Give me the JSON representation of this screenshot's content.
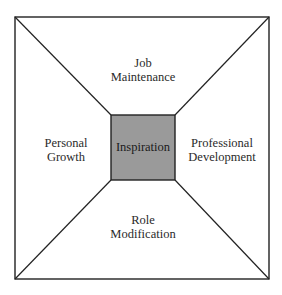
{
  "diagram": {
    "center": {
      "label": "Inspiration",
      "fill": "#9a9a9a"
    },
    "regions": {
      "top": {
        "line1": "Job",
        "line2": "Maintenance"
      },
      "left": {
        "line1": "Personal",
        "line2": "Growth"
      },
      "right": {
        "line1": "Professional",
        "line2": "Development"
      },
      "bottom": {
        "line1": "Role",
        "line2": "Modification"
      }
    },
    "colors": {
      "stroke": "#222222",
      "background": "#ffffff"
    }
  }
}
